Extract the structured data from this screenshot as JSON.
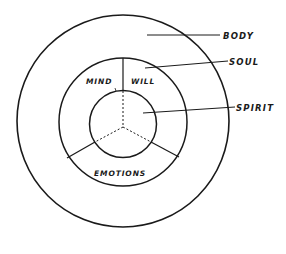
{
  "diagram": {
    "type": "concentric-circles",
    "colors": {
      "line": "#1a1a1a",
      "background": "#ffffff"
    },
    "rings": [
      {
        "id": "body",
        "label": "BODY"
      },
      {
        "id": "soul",
        "label": "SOUL"
      },
      {
        "id": "spirit",
        "label": "SPIRIT"
      }
    ],
    "soul_sections": [
      {
        "id": "mind",
        "label": "MIND"
      },
      {
        "id": "will",
        "label": "WILL"
      },
      {
        "id": "emotions",
        "label": "EMOTIONS"
      }
    ]
  }
}
